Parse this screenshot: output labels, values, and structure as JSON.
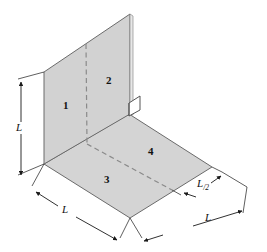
{
  "figure": {
    "background_color": "#ffffff",
    "panel_fill_color": "#d4d4d4",
    "panel_edge_color": "#6b6b6b",
    "dimension_line_color": "#1a1a1a",
    "dashed_line_color": "#8a8a8a"
  },
  "surfaces": [
    {
      "id": "1",
      "label": "1",
      "description": "vertical plate left half"
    },
    {
      "id": "2",
      "label": "2",
      "description": "vertical plate right half"
    },
    {
      "id": "3",
      "label": "3",
      "description": "horizontal plate near half"
    },
    {
      "id": "4",
      "label": "4",
      "description": "horizontal plate far half"
    }
  ],
  "dimensions": [
    {
      "id": "height",
      "label": "L",
      "subscript": "",
      "description": "vertical height of upright plate"
    },
    {
      "id": "width-front",
      "label": "L",
      "subscript": "",
      "description": "front bottom edge length"
    },
    {
      "id": "depth-half",
      "label": "L",
      "subscript": "/2",
      "description": "half depth of horizontal plate"
    },
    {
      "id": "depth-full",
      "label": "L",
      "subscript": "",
      "description": "full depth of horizontal plate"
    }
  ]
}
